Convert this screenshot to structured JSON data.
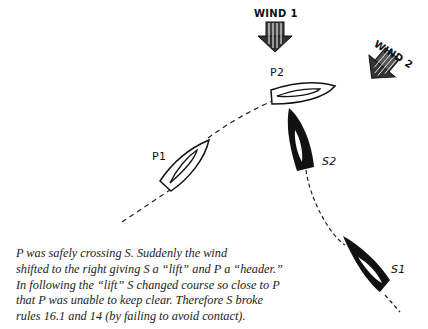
{
  "labels": {
    "wind1": "WIND 1",
    "wind2": "WIND 2",
    "p1": "P1",
    "p2": "P2",
    "s1": "S1",
    "s2": "S2"
  },
  "caption": {
    "lines": [
      "P was safely crossing S. Suddenly the wind",
      "shifted to the right giving S a “lift” and P a “header.”",
      "In following the “lift” S changed course so close to P",
      "that P was unable to keep clear. Therefore S broke",
      "rules 16.1 and 14 (by failing to avoid contact)."
    ]
  },
  "colors": {
    "ink": "#111111",
    "background": "#ffffff"
  }
}
